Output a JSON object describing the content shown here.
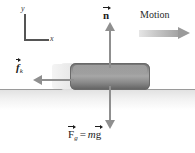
{
  "figure": {
    "background_color": "#ffffff",
    "width": 195,
    "height": 153
  },
  "axes": {
    "y_label": "y",
    "x_label": "x",
    "color": "#555555"
  },
  "motion": {
    "label": "Motion",
    "direction": "right",
    "arrow_color": "#9a9a9a"
  },
  "block": {
    "name": "sliding-block",
    "fill_top": "#8d8d8d",
    "fill_bottom": "#5f5f5f",
    "has_motion_blur_trail": true
  },
  "surface": {
    "name": "ground-surface",
    "line_color": "#9a9a9a"
  },
  "forces": [
    {
      "id": "normal",
      "symbol": "n",
      "subscript": "",
      "direction": "up",
      "vector_arrow": true,
      "bold": true,
      "italic": false,
      "color": "#8f8f8f"
    },
    {
      "id": "kinetic-friction",
      "symbol": "f",
      "subscript": "k",
      "direction": "left",
      "vector_arrow": true,
      "bold": true,
      "italic": true,
      "color": "#8f8f8f"
    },
    {
      "id": "gravity",
      "symbol": "F",
      "subscript": "g",
      "direction": "down",
      "vector_arrow": true,
      "bold": true,
      "italic": false,
      "color": "#8f8f8f"
    }
  ],
  "gravity_equation": {
    "lhs_symbol": "F",
    "lhs_subscript": "g",
    "equals": "=",
    "rhs_mass": "m",
    "rhs_symbol": "g"
  }
}
